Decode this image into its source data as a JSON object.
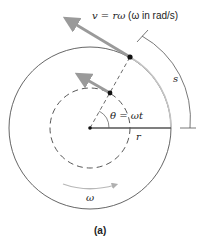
{
  "diagram": {
    "velocity_label_italic": "v = rω",
    "velocity_label_rest": " (ω in rad/s)",
    "angle_label": "θ = ωt",
    "radius_label": "r",
    "arc_label": "s",
    "omega_label": "ω",
    "caption": "(a)",
    "colors": {
      "line": "#555555",
      "arrow": "#9a9a9a",
      "highlight_arc": "#bdbdbd",
      "point": "#111111"
    }
  }
}
